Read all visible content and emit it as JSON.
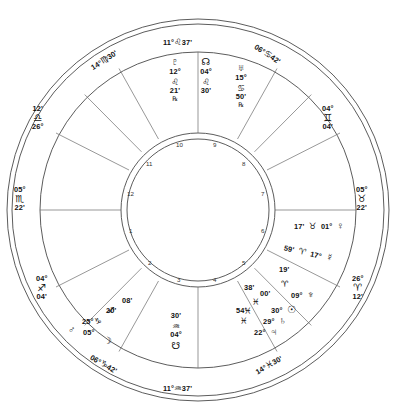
{
  "chart": {
    "type": "natal-astrology-wheel",
    "angles": {
      "mc": {
        "deg": "11°",
        "sign": "♌",
        "min": "37'",
        "sign_name": "Leo",
        "label": "11°♌37'"
      },
      "ic": {
        "deg": "11°",
        "sign": "♒",
        "min": "37'",
        "sign_name": "Aquarius",
        "label": "11°♒37'"
      },
      "asc": {
        "deg": "05°",
        "sign": "♏",
        "min": "22'",
        "sign_name": "Scorpio"
      },
      "dsc": {
        "deg": "05°",
        "sign": "♉",
        "min": "22'",
        "sign_name": "Taurus"
      }
    },
    "cusps": [
      {
        "id": "cusp-11",
        "deg": "14°",
        "sign": "♍",
        "min": "30'",
        "sign_name": "Virgo",
        "label": "14°♍30'"
      },
      {
        "id": "cusp-10-mc",
        "deg": "11°",
        "sign": "♌",
        "min": "37'",
        "sign_name": "Leo",
        "label": "11°♌37'"
      },
      {
        "id": "cusp-9",
        "deg": "06°",
        "sign": "♋",
        "min": "42'",
        "sign_name": "Cancer",
        "label": "06°♋42'"
      },
      {
        "id": "cusp-8",
        "deg": "04°",
        "sign": "♊",
        "min": "04'",
        "sign_name": "Gemini"
      },
      {
        "id": "cusp-7-dsc",
        "deg": "05°",
        "sign": "♉",
        "min": "22'",
        "sign_name": "Taurus"
      },
      {
        "id": "cusp-6",
        "deg": "26°",
        "sign": "♈",
        "min": "12'",
        "sign_name": "Aries"
      },
      {
        "id": "cusp-5",
        "deg": "14°",
        "sign": "♓",
        "min": "30'",
        "sign_name": "Pisces",
        "label": "14°♓30'"
      },
      {
        "id": "cusp-4-ic",
        "deg": "11°",
        "sign": "♒",
        "min": "37'",
        "sign_name": "Aquarius",
        "label": "11°♒37'"
      },
      {
        "id": "cusp-3",
        "deg": "06°",
        "sign": "♑",
        "min": "42'",
        "sign_name": "Capricorn",
        "label": "06°♑42'"
      },
      {
        "id": "cusp-2",
        "deg": "04°",
        "sign": "♐",
        "min": "04'",
        "sign_name": "Sagittarius"
      },
      {
        "id": "cusp-1-asc",
        "deg": "05°",
        "sign": "♏",
        "min": "22'",
        "sign_name": "Scorpio"
      },
      {
        "id": "cusp-12",
        "deg": "26°",
        "sign": "♎",
        "min": "12'",
        "sign_name": "Libra"
      }
    ],
    "house_numbers": [
      "1",
      "2",
      "3",
      "4",
      "5",
      "6",
      "7",
      "8",
      "9",
      "10",
      "11",
      "12"
    ],
    "planets": [
      {
        "name": "Pluto",
        "glyph": "♇",
        "deg": "12°",
        "sign": "♌",
        "sign_name": "Leo",
        "min": "21'",
        "retrograde": "℞"
      },
      {
        "name": "North Node",
        "glyph": "☊",
        "deg": "04°",
        "sign": "♌",
        "sign_name": "Leo",
        "min": "30'",
        "retrograde": ""
      },
      {
        "name": "Uranus",
        "glyph": "♅",
        "deg": "15°",
        "sign": "♋",
        "sign_name": "Cancer",
        "min": "50'",
        "retrograde": "℞"
      },
      {
        "name": "Venus",
        "glyph": "♀",
        "deg": "01°",
        "sign": "♉",
        "sign_name": "Taurus",
        "min": "17'",
        "retrograde": ""
      },
      {
        "name": "Mercury",
        "glyph": "☿",
        "deg": "17°",
        "sign": "♈",
        "sign_name": "Aries",
        "min": "59'",
        "retrograde": ""
      },
      {
        "name": "Neptune",
        "glyph": "♆",
        "deg": "09°",
        "sign": "♈",
        "sign_name": "Aries",
        "min": "19'",
        "retrograde": ""
      },
      {
        "name": "Sun",
        "glyph": "☉",
        "deg": "30°",
        "sign": "♓",
        "sign_name": "Pisces",
        "min": "00'",
        "retrograde": ""
      },
      {
        "name": "Saturn",
        "glyph": "♄",
        "deg": "29°",
        "sign": "♓",
        "sign_name": "Pisces",
        "min": "38'",
        "retrograde": ""
      },
      {
        "name": "Jupiter",
        "glyph": "♃",
        "deg": "22°",
        "sign": "♓",
        "sign_name": "Pisces",
        "min": "54'",
        "retrograde": ""
      },
      {
        "name": "South Node",
        "glyph": "☋",
        "deg": "04°",
        "sign": "♒",
        "sign_name": "Aquarius",
        "min": "30'",
        "retrograde": ""
      },
      {
        "name": "Moon",
        "glyph": "☽",
        "deg": "05°",
        "sign": "♑",
        "sign_name": "Capricorn",
        "min": "20'",
        "retrograde": ""
      },
      {
        "name": "Mars",
        "glyph": "♂",
        "deg": "25°",
        "sign": "♐",
        "sign_name": "Sagittarius",
        "min": "08'",
        "retrograde": ""
      }
    ]
  }
}
